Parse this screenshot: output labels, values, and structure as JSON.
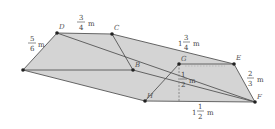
{
  "diagram": {
    "fill_color": "#d4d4d4",
    "edge_color": "#555555",
    "points": [
      {
        "name": "A",
        "label": "",
        "x": 23,
        "y": 70
      },
      {
        "name": "D",
        "label": "D",
        "x": 57,
        "y": 33
      },
      {
        "name": "C",
        "label": "C",
        "x": 112,
        "y": 34
      },
      {
        "name": "B",
        "label": "B",
        "x": 133,
        "y": 70
      },
      {
        "name": "G",
        "label": "G",
        "x": 179,
        "y": 64
      },
      {
        "name": "E",
        "label": "E",
        "x": 234,
        "y": 64
      },
      {
        "name": "F",
        "label": "F",
        "x": 255,
        "y": 102
      },
      {
        "name": "H",
        "label": "H",
        "x": 145,
        "y": 101
      }
    ],
    "measurements": {
      "dc": {
        "whole": "",
        "num": "3",
        "den": "4",
        "unit": "m"
      },
      "ad": {
        "whole": "",
        "num": "5",
        "den": "6",
        "unit": "m"
      },
      "ce": {
        "whole": "1",
        "num": "3",
        "den": "4",
        "unit": "m"
      },
      "height": {
        "whole": "",
        "num": "1",
        "den": "2",
        "unit": "m"
      },
      "ef": {
        "whole": "",
        "num": "2",
        "den": "3",
        "unit": "m"
      },
      "hf": {
        "whole": "1",
        "num": "1",
        "den": "2",
        "unit": "m"
      }
    }
  }
}
